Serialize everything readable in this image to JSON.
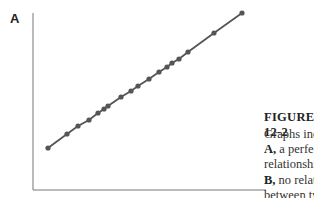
{
  "figure": {
    "panel_label": "A",
    "title": "FIGURE 12-2",
    "caption_lines": [
      {
        "bold": "",
        "text": "Graphs indicating"
      },
      {
        "bold": "A,",
        "text": " a perfect"
      },
      {
        "bold": "",
        "text": "relationship and"
      },
      {
        "bold": "B,",
        "text": " no relationship"
      },
      {
        "bold": "",
        "text": "between two"
      },
      {
        "bold": "",
        "text": "variables."
      }
    ]
  },
  "chart_data": {
    "type": "line",
    "title": "",
    "xlabel": "",
    "ylabel": "",
    "grid": false,
    "legend": "none",
    "pixel_points": [
      [
        48,
        148
      ],
      [
        67,
        134
      ],
      [
        78,
        126
      ],
      [
        89,
        120
      ],
      [
        98,
        113
      ],
      [
        104,
        109
      ],
      [
        108,
        106
      ],
      [
        121,
        97
      ],
      [
        131,
        91
      ],
      [
        138,
        86
      ],
      [
        149,
        79
      ],
      [
        159,
        72
      ],
      [
        167,
        67
      ],
      [
        172,
        63
      ],
      [
        179,
        59
      ],
      [
        188,
        52
      ],
      [
        214,
        33
      ],
      [
        242,
        13
      ]
    ],
    "colors": {
      "line": "#555555",
      "marker": "#555555",
      "axis": "#777777"
    }
  }
}
